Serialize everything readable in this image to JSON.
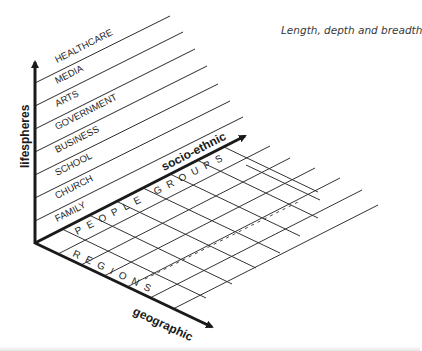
{
  "caption": "Length, depth and breadth",
  "axes": {
    "vertical": "lifespheres",
    "depth": "socio-ethnic",
    "horizontal": "geographic"
  },
  "lifespheres": [
    "HEALTHCARE",
    "MEDIA",
    "ARTS",
    "GOVERNMENT",
    "BUSINESS",
    "SCHOOL",
    "CHURCH",
    "FAMILY"
  ],
  "grid_labels": {
    "socio_ethnic_row": "PEOPLE GROUPS",
    "geographic_row": "REGIONS"
  },
  "colors": {
    "ink": "#1a1a1a",
    "grid": "#333333",
    "caption": "#3a3a3a"
  }
}
